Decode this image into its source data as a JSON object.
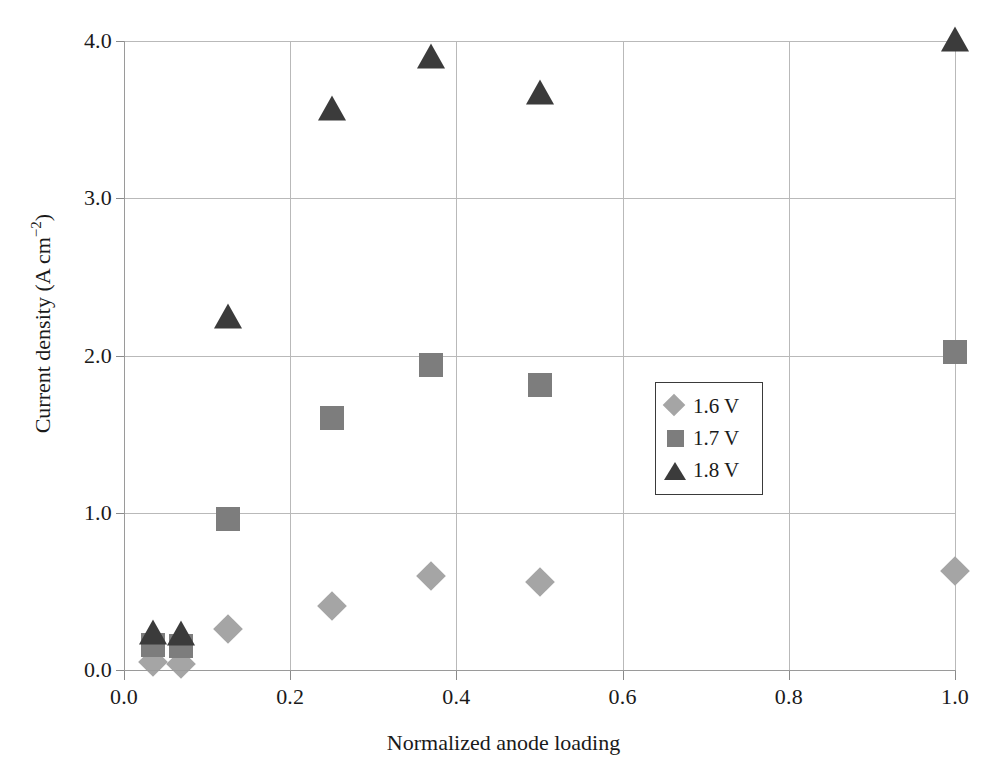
{
  "chart_data": {
    "type": "scatter",
    "title": "",
    "xlabel": "Normalized anode loading",
    "ylabel": "Current density (A cm",
    "ylabel_sup": "−2",
    "ylabel_tail": ")",
    "xlim": [
      0.0,
      1.0
    ],
    "ylim": [
      0.0,
      4.0
    ],
    "grid": true,
    "legend_position": "center-right",
    "xticks": [
      "0.0",
      "0.2",
      "0.4",
      "0.6",
      "0.8",
      "1.0"
    ],
    "xtick_values": [
      0.0,
      0.2,
      0.4,
      0.6,
      0.8,
      1.0
    ],
    "yticks": [
      "0.0",
      "1.0",
      "2.0",
      "3.0",
      "4.0"
    ],
    "ytick_values": [
      0.0,
      1.0,
      2.0,
      3.0,
      4.0
    ],
    "series": [
      {
        "name": "1.6 V",
        "marker": "diamond",
        "color": "#a5a5a5",
        "points": [
          {
            "x": 0.035,
            "y": 0.05
          },
          {
            "x": 0.068,
            "y": 0.04
          },
          {
            "x": 0.125,
            "y": 0.26
          },
          {
            "x": 0.25,
            "y": 0.41
          },
          {
            "x": 0.37,
            "y": 0.6
          },
          {
            "x": 0.5,
            "y": 0.56
          },
          {
            "x": 1.0,
            "y": 0.63
          }
        ]
      },
      {
        "name": "1.7 V",
        "marker": "square",
        "color": "#7d7d7d",
        "points": [
          {
            "x": 0.035,
            "y": 0.16
          },
          {
            "x": 0.068,
            "y": 0.15
          },
          {
            "x": 0.125,
            "y": 0.96
          },
          {
            "x": 0.25,
            "y": 1.6
          },
          {
            "x": 0.37,
            "y": 1.94
          },
          {
            "x": 0.5,
            "y": 1.81
          },
          {
            "x": 1.0,
            "y": 2.02
          }
        ]
      },
      {
        "name": "1.8 V",
        "marker": "triangle",
        "color": "#3b3b3b",
        "points": [
          {
            "x": 0.035,
            "y": 0.23
          },
          {
            "x": 0.068,
            "y": 0.22
          },
          {
            "x": 0.125,
            "y": 2.24
          },
          {
            "x": 0.25,
            "y": 3.56
          },
          {
            "x": 0.37,
            "y": 3.89
          },
          {
            "x": 0.5,
            "y": 3.66
          },
          {
            "x": 1.0,
            "y": 4.0
          }
        ]
      }
    ]
  },
  "legend": {
    "entries": [
      {
        "label": "1.6 V",
        "marker": "diamond",
        "color": "#a5a5a5"
      },
      {
        "label": "1.7 V",
        "marker": "square",
        "color": "#7d7d7d"
      },
      {
        "label": "1.8 V",
        "marker": "triangle",
        "color": "#3b3b3b"
      }
    ]
  },
  "colors": {
    "grid": "#b9b9b9",
    "axis": "#9a9a9a",
    "text": "#1a1a1a",
    "background": "#ffffff"
  }
}
